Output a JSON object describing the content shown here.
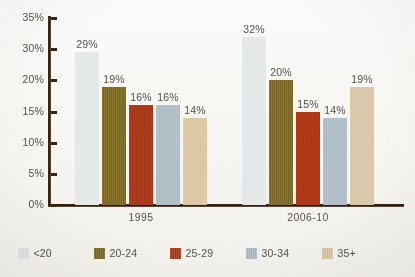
{
  "chart_data": {
    "type": "bar",
    "title": "",
    "subtitle": "",
    "xlabel": "",
    "ylabel": "",
    "categories": [
      "1995",
      "2006-10"
    ],
    "series": [
      {
        "name": "<20",
        "color": "#e3e8e8",
        "values": [
          29,
          32
        ],
        "labels": [
          "29%",
          "32%"
        ]
      },
      {
        "name": "20-24",
        "color": "#7d6a28",
        "values": [
          19,
          20
        ],
        "labels": [
          "19%",
          "20%"
        ]
      },
      {
        "name": "25-29",
        "color": "#ab3718",
        "values": [
          16,
          15
        ],
        "labels": [
          "16%",
          "15%"
        ]
      },
      {
        "name": "30-34",
        "color": "#aebdc5",
        "values": [
          16,
          14
        ],
        "labels": [
          "16%",
          "14%"
        ]
      },
      {
        "name": "35+",
        "color": "#dbc7a6",
        "values": [
          14,
          19
        ],
        "labels": [
          "14%",
          "19%"
        ]
      }
    ],
    "ylim": [
      0,
      35
    ],
    "ytick_labels": [
      "35%",
      "30%",
      "20%",
      "15%",
      "10%",
      "5%",
      "0%"
    ],
    "ytick_values": [
      35,
      30,
      20,
      15,
      10,
      5,
      0
    ],
    "grid": false,
    "legend_position": "bottom",
    "axis_color": "#3a2314",
    "value_label_color": "#55504c",
    "background_color": "#f8f7f4"
  },
  "axis": {
    "ticks": [
      {
        "label": "35%"
      },
      {
        "label": "30%"
      },
      {
        "label": "20%"
      },
      {
        "label": "15%"
      },
      {
        "label": "10%"
      },
      {
        "label": "5%"
      },
      {
        "label": "0%"
      }
    ]
  },
  "groups": [
    {
      "category": "1995",
      "bars": [
        {
          "series": "<20",
          "label": "29%"
        },
        {
          "series": "20-24",
          "label": "19%"
        },
        {
          "series": "25-29",
          "label": "16%"
        },
        {
          "series": "30-34",
          "label": "16%"
        },
        {
          "series": "35+",
          "label": "14%"
        }
      ]
    },
    {
      "category": "2006-10",
      "bars": [
        {
          "series": "<20",
          "label": "32%"
        },
        {
          "series": "20-24",
          "label": "20%"
        },
        {
          "series": "25-29",
          "label": "15%"
        },
        {
          "series": "30-34",
          "label": "14%"
        },
        {
          "series": "35+",
          "label": "19%"
        }
      ]
    }
  ],
  "legend": {
    "items": [
      {
        "label": "<20"
      },
      {
        "label": "20-24"
      },
      {
        "label": "25-29"
      },
      {
        "label": "30-34"
      },
      {
        "label": "35+"
      }
    ]
  }
}
